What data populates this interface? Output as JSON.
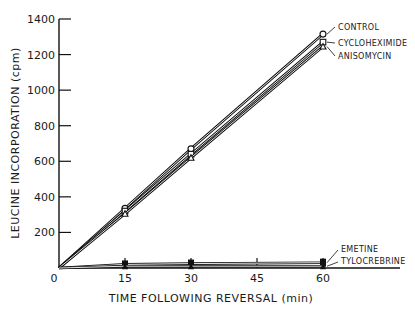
{
  "chart_data": {
    "type": "line",
    "title": "",
    "xlabel": "TIME FOLLOWING REVERSAL (min)",
    "ylabel": "LEUCINE INCORPORATION (cpm)",
    "x": [
      0,
      15,
      30,
      60
    ],
    "xticks": [
      0,
      15,
      30,
      45,
      60
    ],
    "yticks": [
      0,
      200,
      400,
      600,
      800,
      1000,
      1200,
      1400
    ],
    "xlim": [
      0,
      70
    ],
    "ylim": [
      0,
      1400
    ],
    "grid": false,
    "legend_position": "inline-right",
    "series": [
      {
        "name": "CONTROL",
        "marker": "open-circle",
        "values": [
          0,
          335,
          670,
          1315
        ]
      },
      {
        "name": "CYCLOHEXIMIDE",
        "marker": "open-square",
        "values": [
          0,
          320,
          640,
          1270
        ]
      },
      {
        "name": "ANISOMYCIN",
        "marker": "open-triangle",
        "values": [
          0,
          305,
          620,
          1245
        ]
      },
      {
        "name": "EMETINE",
        "marker": "filled-square",
        "values": [
          0,
          20,
          25,
          30
        ]
      },
      {
        "name": "TYLOCREBRINE",
        "marker": "filled-triangle",
        "values": [
          0,
          10,
          10,
          10
        ]
      }
    ]
  },
  "labels": {
    "xlabel": "TIME FOLLOWING REVERSAL (min)",
    "ylabel": "LEUCINE INCORPORATION (cpm)"
  }
}
